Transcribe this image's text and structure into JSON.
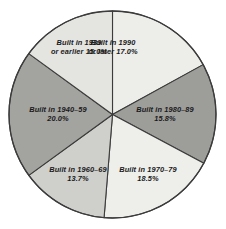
{
  "chart_data": {
    "type": "pie",
    "title": "",
    "subtitle": "",
    "xlabel": "",
    "ylabel": "",
    "legend_position": "none",
    "grid": false,
    "start_angle_deg": 0,
    "direction": "clockwise",
    "units": "percent",
    "categories": [
      "Built in 1990 or later",
      "Built in 1980–89",
      "Built in 1970–79",
      "Built in 1960–69",
      "Built in 1940–59",
      "Built in 1939 or earlier"
    ],
    "values": [
      17.0,
      15.8,
      18.5,
      13.7,
      20.0,
      15.0
    ],
    "value_labels": [
      "17.0%",
      "15.8%",
      "18.5%",
      "13.7%",
      "20.0%",
      "15.0%"
    ],
    "colors": [
      "#ededea",
      "#9d9d9a",
      "#eeeeeb",
      "#cfcfcc",
      "#a3a3a0",
      "#e4e4e1"
    ],
    "slices": [
      {
        "name": "slice-1990-or-later",
        "category": "Built in 1990 or later",
        "value": 17.0,
        "value_label": "17.0%",
        "color": "#ededea",
        "label_line1": "Built in 1990",
        "label_line2": "or later 17.0%"
      },
      {
        "name": "slice-1980-89",
        "category": "Built in 1980–89",
        "value": 15.8,
        "value_label": "15.8%",
        "color": "#9d9d9a",
        "label_line1": "Built in 1980–89",
        "label_line2": "15.8%"
      },
      {
        "name": "slice-1970-79",
        "category": "Built in 1970–79",
        "value": 18.5,
        "value_label": "18.5%",
        "color": "#eeeeeb",
        "label_line1": "Built in 1970–79",
        "label_line2": "18.5%"
      },
      {
        "name": "slice-1960-69",
        "category": "Built in 1960–69",
        "value": 13.7,
        "value_label": "13.7%",
        "color": "#cfcfcc",
        "label_line1": "Built in 1960–69",
        "label_line2": "13.7%"
      },
      {
        "name": "slice-1940-59",
        "category": "Built in 1940–59",
        "value": 20.0,
        "value_label": "20.0%",
        "color": "#a3a3a0",
        "label_line1": "Built in 1940–59",
        "label_line2": "20.0%"
      },
      {
        "name": "slice-1939-or-earlier",
        "category": "Built in 1939 or earlier",
        "value": 15.0,
        "value_label": "15.0%",
        "color": "#e4e4e1",
        "label_line1": "Built in 1939",
        "label_line2": "or earlier 15.0%"
      }
    ],
    "outline_color": "#3c3c3c",
    "background_color": "#ffffff"
  }
}
